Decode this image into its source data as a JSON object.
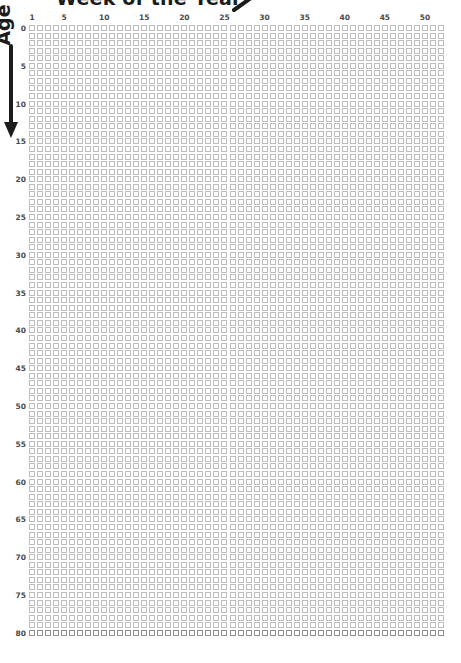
{
  "title": {
    "text": "Week of the Year",
    "arrow_icon": "arrow-up-right-icon"
  },
  "y_axis": {
    "label": "Age",
    "arrow_icon": "arrow-down-icon",
    "ticks": [
      0,
      5,
      10,
      15,
      20,
      25,
      30,
      35,
      40,
      45,
      50,
      55,
      60,
      65,
      70,
      75,
      80
    ],
    "min": 0,
    "max": 80,
    "rows": 81,
    "direction": "top-to-bottom"
  },
  "x_axis": {
    "label": "Week of the Year",
    "ticks": [
      1,
      5,
      10,
      15,
      20,
      25,
      30,
      35,
      40,
      45,
      50
    ],
    "min": 1,
    "max": 52,
    "columns": 52
  },
  "colors": {
    "cell_stroke": "#bdbdbd",
    "cell_stroke_strong": "#8f8f8f",
    "cell_fill": "#ffffff",
    "tick_text": "#4a4a4a",
    "title_text": "#1c1c1c",
    "background": "#ffffff"
  },
  "chart_data": {
    "type": "heatmap",
    "title": "Week of the Year",
    "xlabel": "Week of the Year",
    "ylabel": "Age",
    "x": [
      1,
      2,
      3,
      4,
      5,
      6,
      7,
      8,
      9,
      10,
      11,
      12,
      13,
      14,
      15,
      16,
      17,
      18,
      19,
      20,
      21,
      22,
      23,
      24,
      25,
      26,
      27,
      28,
      29,
      30,
      31,
      32,
      33,
      34,
      35,
      36,
      37,
      38,
      39,
      40,
      41,
      42,
      43,
      44,
      45,
      46,
      47,
      48,
      49,
      50,
      51,
      52
    ],
    "xtick_labels": [
      "1",
      "5",
      "10",
      "15",
      "20",
      "25",
      "30",
      "35",
      "40",
      "45",
      "50"
    ],
    "xtick_positions": [
      1,
      5,
      10,
      15,
      20,
      25,
      30,
      35,
      40,
      45,
      50
    ],
    "y": [
      0,
      1,
      2,
      3,
      4,
      5,
      6,
      7,
      8,
      9,
      10,
      11,
      12,
      13,
      14,
      15,
      16,
      17,
      18,
      19,
      20,
      21,
      22,
      23,
      24,
      25,
      26,
      27,
      28,
      29,
      30,
      31,
      32,
      33,
      34,
      35,
      36,
      37,
      38,
      39,
      40,
      41,
      42,
      43,
      44,
      45,
      46,
      47,
      48,
      49,
      50,
      51,
      52,
      53,
      54,
      55,
      56,
      57,
      58,
      59,
      60,
      61,
      62,
      63,
      64,
      65,
      66,
      67,
      68,
      69,
      70,
      71,
      72,
      73,
      74,
      75,
      76,
      77,
      78,
      79,
      80
    ],
    "ytick_labels": [
      "0",
      "5",
      "10",
      "15",
      "20",
      "25",
      "30",
      "35",
      "40",
      "45",
      "50",
      "55",
      "60",
      "65",
      "70",
      "75",
      "80"
    ],
    "ytick_positions": [
      0,
      5,
      10,
      15,
      20,
      25,
      30,
      35,
      40,
      45,
      50,
      55,
      60,
      65,
      70,
      75,
      80
    ],
    "xlim": [
      1,
      52
    ],
    "ylim": [
      80,
      0
    ],
    "grid": false,
    "legend": "none",
    "cell_shape": "square-outline",
    "cell_state": "empty",
    "values_note": "All 52 x 81 = 4212 cells are rendered as empty (unfilled) light-gray square outlines.",
    "total_cells": 4212,
    "filled_cells": 0,
    "annotations": []
  }
}
